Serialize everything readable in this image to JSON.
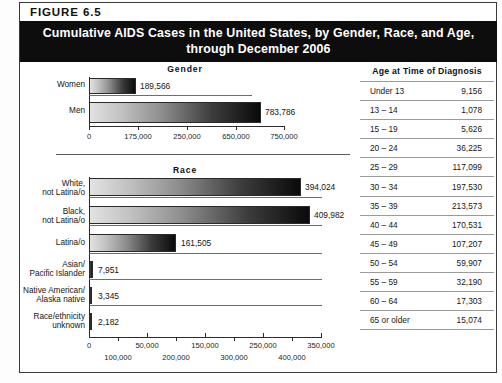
{
  "figure": {
    "number_label": "FIGURE  6.5",
    "title_line1": "Cumulative AIDS Cases in the United States, by Gender, Race, and Age,",
    "title_line2": "through December 2006"
  },
  "gender_section": {
    "heading": "Gender"
  },
  "race_section": {
    "heading": "Race"
  },
  "age_section": {
    "heading": "Age at Time of Diagnosis",
    "rows": [
      {
        "label": "Under 13",
        "value": "9,156"
      },
      {
        "label": "13 – 14",
        "value": "1,078"
      },
      {
        "label": "15 – 19",
        "value": "5,626"
      },
      {
        "label": "20 – 24",
        "value": "36,225"
      },
      {
        "label": "25 – 29",
        "value": "117,099"
      },
      {
        "label": "30 – 34",
        "value": "197,530"
      },
      {
        "label": "35 – 39",
        "value": "213,573"
      },
      {
        "label": "40 – 44",
        "value": "170,531"
      },
      {
        "label": "45 – 49",
        "value": "107,207"
      },
      {
        "label": "50 – 54",
        "value": "59,907"
      },
      {
        "label": "55 – 59",
        "value": "32,190"
      },
      {
        "label": "60 – 64",
        "value": "17,303"
      },
      {
        "label": "65 or older",
        "value": "15,074"
      }
    ]
  },
  "chart_data": [
    {
      "type": "bar",
      "title": "Gender",
      "orientation": "horizontal",
      "categories": [
        "Women",
        "Men"
      ],
      "values": [
        189566,
        783786
      ],
      "value_labels": [
        "189,566",
        "783,786"
      ],
      "xlabel": "",
      "ylabel": "",
      "xlim": [
        0,
        900000
      ],
      "tick_labels": [
        "0",
        "175,000",
        "250,000",
        "650,000",
        "750,000"
      ],
      "grid": false,
      "legend": "none"
    },
    {
      "type": "bar",
      "title": "Race",
      "orientation": "horizontal",
      "categories": [
        "White,\nnot Latina/o",
        "Black,\nnot Latina/o",
        "Latina/o",
        "Asian/\nPacific Islander",
        "Native American/\nAlaska native",
        "Race/ethnicity\nunknown"
      ],
      "values": [
        394024,
        409982,
        161505,
        7951,
        3345,
        2182
      ],
      "value_labels": [
        "394,024",
        "409,982",
        "161,505",
        "7,951",
        "3,345",
        "2,182"
      ],
      "xlabel": "",
      "ylabel": "",
      "xlim": [
        0,
        430000
      ],
      "tick_labels_upper": [
        "0",
        "50,000",
        "150,000",
        "250,000",
        "350,000"
      ],
      "tick_labels_lower": [
        "100,000",
        "200,000",
        "300,000",
        "400,000"
      ],
      "grid": false,
      "legend": "none"
    },
    {
      "type": "table",
      "title": "Age at Time of Diagnosis",
      "columns": [
        "Age at Time of Diagnosis",
        ""
      ],
      "categories": [
        "Under 13",
        "13 – 14",
        "15 – 19",
        "20 – 24",
        "25 – 29",
        "30 – 34",
        "35 – 39",
        "40 – 44",
        "45 – 49",
        "50 – 54",
        "55 – 59",
        "60 – 64",
        "65 or older"
      ],
      "values": [
        9156,
        1078,
        5626,
        36225,
        117099,
        197530,
        213573,
        170531,
        107207,
        59907,
        32190,
        17303,
        15074
      ]
    }
  ],
  "colors": {
    "banner_bg": "#0d0d0d",
    "banner_text": "#ffffff",
    "bar_light": "#e2e2e2",
    "bar_dark": "#0a0a0a",
    "rule": "#9a9a9a"
  }
}
